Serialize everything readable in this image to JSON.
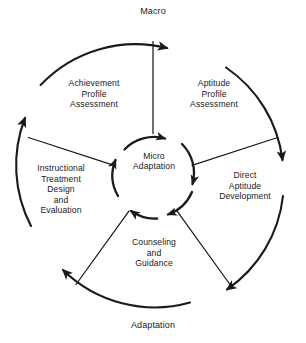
{
  "figure": {
    "type": "cyclic-process-diagram",
    "shape": "concentric-rings-five-sectors",
    "rotation": "clockwise",
    "stroke_color": "#1a1a1a",
    "background_color": "#ffffff",
    "center": {
      "label": "Micro\nAdaptation"
    },
    "outer_ring_labels": {
      "top": "Macro",
      "bottom": "Adaptation"
    },
    "sectors": [
      {
        "id": "achievement-profile-assessment",
        "label": "Achievement\nProfile\nAssessment",
        "position": "top-left"
      },
      {
        "id": "aptitude-profile-assessment",
        "label": "Aptitude\nProfile\nAssessment",
        "position": "top-right"
      },
      {
        "id": "direct-aptitude-development",
        "label": "Direct\nAptitude\nDevelopment",
        "position": "right"
      },
      {
        "id": "counseling-and-guidance",
        "label": "Counseling\nand\nGuidance",
        "position": "bottom"
      },
      {
        "id": "instructional-treatment-design-and-evaluation",
        "label": "Instructional\nTreatment\nDesign\nand\nEvaluation",
        "position": "left"
      }
    ],
    "arrow_count": {
      "outer": 5,
      "inner": 5
    },
    "spoke_count": 5
  }
}
